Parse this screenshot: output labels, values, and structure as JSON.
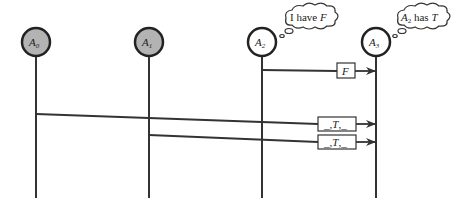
{
  "diagram": {
    "type": "sequence",
    "colors": {
      "line": "#333333",
      "honest_fill": "#ffffff",
      "faulty_fill": "#b3b3b3"
    },
    "agents": [
      {
        "id": "A0",
        "base": "A",
        "sub": "0",
        "fill": "gray"
      },
      {
        "id": "A1",
        "base": "A",
        "sub": "1",
        "fill": "gray"
      },
      {
        "id": "A2",
        "base": "A",
        "sub": "2",
        "fill": "white"
      },
      {
        "id": "A3",
        "base": "A",
        "sub": "3",
        "fill": "white"
      }
    ],
    "thoughts": [
      {
        "agent": "A2",
        "prefix": "I have ",
        "var": "F"
      },
      {
        "agent": "A3",
        "base": "A",
        "sub": "2",
        "mid": " has ",
        "var": "T"
      }
    ],
    "messages": [
      {
        "from": "A2",
        "to": "A3",
        "label": "F"
      },
      {
        "from": "A0",
        "to": "A3",
        "label": "_,T,_"
      },
      {
        "from": "A1",
        "to": "A3",
        "label": "_,T,_"
      }
    ],
    "msg_label_pre": "_,",
    "msg_label_var": "T",
    "msg_label_post": ",_"
  }
}
